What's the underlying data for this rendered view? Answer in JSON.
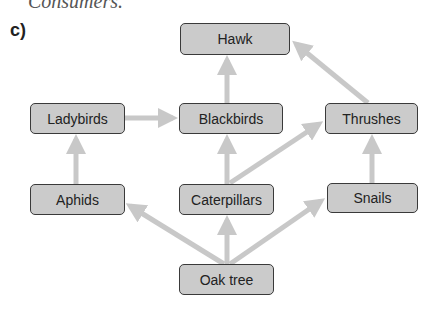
{
  "caption": "Consumers.",
  "part_label": "c)",
  "colors": {
    "node_fill": "#cbcbcb",
    "node_border": "#3a3a3a",
    "arrow": "#c8c8c8"
  },
  "nodes": {
    "hawk": "Hawk",
    "ladybirds": "Ladybirds",
    "blackbirds": "Blackbirds",
    "thrushes": "Thrushes",
    "aphids": "Aphids",
    "caterpillars": "Caterpillars",
    "snails": "Snails",
    "oak_tree": "Oak tree"
  },
  "edges": [
    {
      "from": "Oak tree",
      "to": "Aphids"
    },
    {
      "from": "Oak tree",
      "to": "Caterpillars"
    },
    {
      "from": "Oak tree",
      "to": "Snails"
    },
    {
      "from": "Aphids",
      "to": "Ladybirds"
    },
    {
      "from": "Ladybirds",
      "to": "Blackbirds"
    },
    {
      "from": "Caterpillars",
      "to": "Blackbirds"
    },
    {
      "from": "Caterpillars",
      "to": "Thrushes"
    },
    {
      "from": "Snails",
      "to": "Thrushes"
    },
    {
      "from": "Blackbirds",
      "to": "Hawk"
    },
    {
      "from": "Thrushes",
      "to": "Hawk"
    }
  ]
}
